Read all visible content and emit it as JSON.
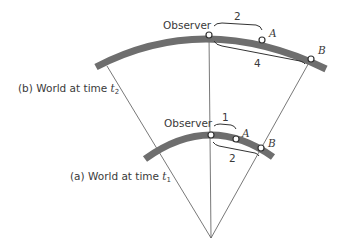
{
  "diagram": {
    "colors": {
      "arc": "#6e6e6e",
      "line": "#555555",
      "dot_fill": "#ffffff",
      "dot_stroke": "#333333",
      "text": "#3a3a3a"
    },
    "world_b": {
      "caption_prefix": "(b) World at time ",
      "caption_var": "t",
      "caption_sub": "2",
      "observer_label": "Observer",
      "point_a_label": "A",
      "point_b_label": "B",
      "distance_observer_a": "2",
      "distance_observer_b": "4"
    },
    "world_a": {
      "caption_prefix": "(a) World at time ",
      "caption_var": "t",
      "caption_sub": "1",
      "observer_label": "Observer",
      "point_a_label": "A",
      "point_b_label": "B",
      "distance_observer_a": "1",
      "distance_observer_b": "2"
    }
  }
}
